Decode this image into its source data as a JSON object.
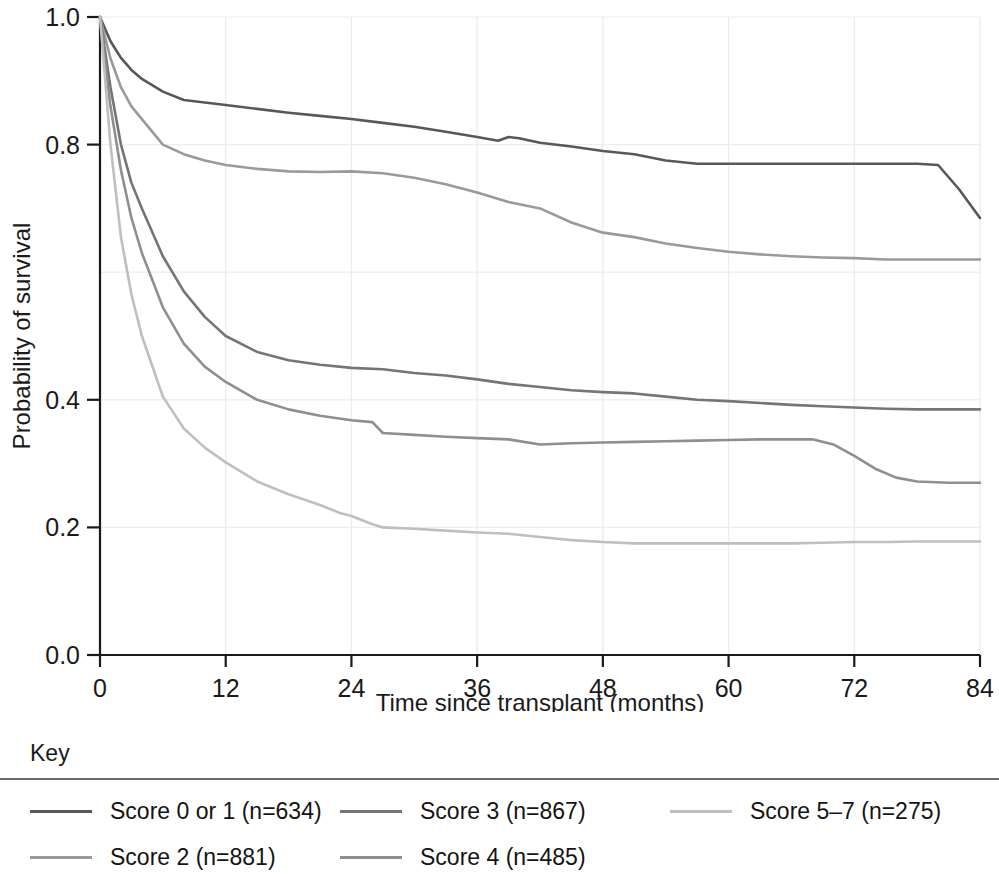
{
  "chart_data": {
    "type": "line",
    "title": "",
    "xlabel": "Time since transplant (months)",
    "ylabel": "Probability of survival",
    "xlim": [
      0,
      84
    ],
    "ylim": [
      0.0,
      1.0
    ],
    "xticks": [
      "0",
      "12",
      "24",
      "36",
      "48",
      "60",
      "72",
      "84"
    ],
    "xtick_values": [
      0,
      12,
      24,
      36,
      48,
      60,
      72,
      84
    ],
    "yticks": [
      "0.0",
      "0.2",
      "0.4",
      "0.8",
      "1.0"
    ],
    "ytick_values": [
      0.0,
      0.2,
      0.4,
      0.8,
      1.0
    ],
    "ytick_all_values": [
      0.0,
      0.2,
      0.4,
      0.6,
      0.8,
      1.0
    ],
    "grid": "vertical-faint",
    "legend_position": "below-plot",
    "legend_title": "Key",
    "series": [
      {
        "name": "Score 0 or 1 (n=634)",
        "n": 634,
        "color": "#585858",
        "x": [
          0,
          1,
          2,
          3,
          4,
          6,
          8,
          10,
          12,
          15,
          18,
          21,
          24,
          27,
          30,
          33,
          36,
          38,
          39,
          40,
          42,
          45,
          48,
          51,
          54,
          57,
          60,
          63,
          66,
          69,
          72,
          75,
          78,
          80,
          82,
          84
        ],
        "y": [
          1.0,
          0.962,
          0.936,
          0.917,
          0.903,
          0.883,
          0.87,
          0.866,
          0.862,
          0.856,
          0.85,
          0.845,
          0.84,
          0.834,
          0.828,
          0.82,
          0.812,
          0.806,
          0.812,
          0.81,
          0.803,
          0.797,
          0.79,
          0.785,
          0.775,
          0.77,
          0.77,
          0.77,
          0.77,
          0.77,
          0.77,
          0.77,
          0.77,
          0.768,
          0.73,
          0.685
        ]
      },
      {
        "name": "Score 2 (n=881)",
        "n": 881,
        "color": "#9a9a9a",
        "x": [
          0,
          1,
          2,
          3,
          4,
          6,
          8,
          10,
          12,
          15,
          18,
          21,
          24,
          27,
          30,
          33,
          36,
          39,
          42,
          45,
          48,
          51,
          54,
          57,
          60,
          63,
          66,
          69,
          72,
          75,
          78,
          81,
          84
        ],
        "y": [
          1.0,
          0.935,
          0.89,
          0.86,
          0.84,
          0.8,
          0.785,
          0.775,
          0.768,
          0.762,
          0.758,
          0.757,
          0.758,
          0.755,
          0.748,
          0.738,
          0.725,
          0.71,
          0.7,
          0.678,
          0.662,
          0.655,
          0.645,
          0.638,
          0.632,
          0.628,
          0.625,
          0.623,
          0.622,
          0.62,
          0.62,
          0.62,
          0.62
        ]
      },
      {
        "name": "Score 3 (n=867)",
        "n": 867,
        "color": "#757575",
        "x": [
          0,
          1,
          2,
          3,
          4,
          6,
          8,
          10,
          12,
          15,
          18,
          21,
          24,
          27,
          30,
          33,
          36,
          39,
          42,
          45,
          48,
          51,
          54,
          57,
          60,
          63,
          66,
          69,
          72,
          75,
          78,
          81,
          84
        ],
        "y": [
          1.0,
          0.89,
          0.8,
          0.74,
          0.7,
          0.625,
          0.57,
          0.53,
          0.5,
          0.475,
          0.462,
          0.455,
          0.45,
          0.448,
          0.442,
          0.438,
          0.432,
          0.425,
          0.42,
          0.415,
          0.412,
          0.41,
          0.405,
          0.4,
          0.398,
          0.395,
          0.392,
          0.39,
          0.388,
          0.386,
          0.385,
          0.385,
          0.385
        ]
      },
      {
        "name": "Score 4 (n=485)",
        "n": 485,
        "color": "#8f8f8f",
        "x": [
          0,
          1,
          2,
          3,
          4,
          6,
          8,
          10,
          12,
          15,
          18,
          21,
          24,
          26,
          27,
          30,
          33,
          36,
          39,
          42,
          45,
          48,
          51,
          54,
          57,
          60,
          63,
          66,
          68,
          70,
          72,
          74,
          76,
          78,
          81,
          84
        ],
        "y": [
          1.0,
          0.86,
          0.76,
          0.685,
          0.63,
          0.545,
          0.488,
          0.452,
          0.428,
          0.4,
          0.385,
          0.375,
          0.368,
          0.365,
          0.348,
          0.345,
          0.342,
          0.34,
          0.338,
          0.33,
          0.332,
          0.333,
          0.334,
          0.335,
          0.336,
          0.337,
          0.338,
          0.338,
          0.338,
          0.33,
          0.312,
          0.292,
          0.278,
          0.272,
          0.27,
          0.27
        ]
      },
      {
        "name": "Score 5–7 (n=275)",
        "n": 275,
        "color": "#bfbfbf",
        "x": [
          0,
          1,
          2,
          3,
          4,
          6,
          8,
          10,
          12,
          15,
          18,
          21,
          23,
          24,
          26,
          27,
          30,
          33,
          36,
          39,
          42,
          45,
          48,
          51,
          54,
          57,
          60,
          63,
          66,
          69,
          72,
          75,
          78,
          81,
          84
        ],
        "y": [
          1.0,
          0.8,
          0.655,
          0.565,
          0.5,
          0.405,
          0.355,
          0.325,
          0.302,
          0.272,
          0.252,
          0.235,
          0.222,
          0.218,
          0.205,
          0.2,
          0.198,
          0.195,
          0.192,
          0.19,
          0.185,
          0.18,
          0.177,
          0.175,
          0.175,
          0.175,
          0.175,
          0.175,
          0.175,
          0.176,
          0.177,
          0.177,
          0.178,
          0.178,
          0.178
        ]
      }
    ]
  },
  "axes": {
    "x_title": "Time since transplant (months)",
    "y_title": "Probability of survival",
    "x_tick_labels": [
      "0",
      "12",
      "24",
      "36",
      "48",
      "60",
      "72",
      "84"
    ],
    "y_tick_labels": [
      "0.0",
      "0.2",
      "0.4",
      "0.8",
      "1.0"
    ]
  },
  "legend": {
    "title": "Key",
    "items": [
      {
        "label": "Score 0 or 1 (n=634)",
        "color": "#585858",
        "column": 0,
        "row": 0
      },
      {
        "label": "Score 3 (n=867)",
        "color": "#757575",
        "column": 1,
        "row": 0
      },
      {
        "label": "Score 5–7 (n=275)",
        "color": "#bfbfbf",
        "column": 2,
        "row": 0
      },
      {
        "label": "Score 2 (n=881)",
        "color": "#9a9a9a",
        "column": 0,
        "row": 1
      },
      {
        "label": "Score 4 (n=485)",
        "color": "#8f8f8f",
        "column": 1,
        "row": 1
      }
    ]
  },
  "colors": {
    "axis": "#1a1a1a",
    "grid": "#ededed",
    "legend_rule": "#6b6b6b",
    "background": "#ffffff"
  }
}
